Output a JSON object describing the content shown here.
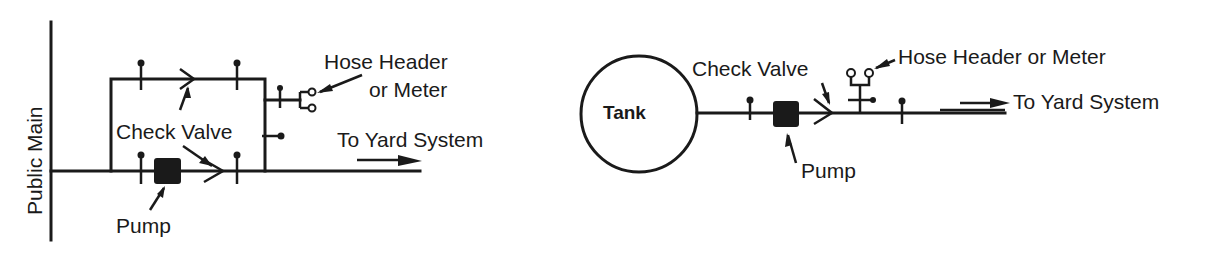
{
  "diagram_left": {
    "title": "Pump bypass from public main",
    "labels": {
      "public_main": "Public Main",
      "hose_header_line1": "Hose Header",
      "hose_header_line2": "or Meter",
      "check_valve": "Check Valve",
      "to_yard": "To Yard System",
      "pump": "Pump"
    }
  },
  "diagram_right": {
    "title": "Pump from tank",
    "labels": {
      "tank": "Tank",
      "check_valve": "Check Valve",
      "hose_header": "Hose Header or Meter",
      "to_yard": "To Yard System",
      "pump": "Pump"
    }
  },
  "colors": {
    "ink": "#1a1a1a",
    "background": "#ffffff"
  }
}
